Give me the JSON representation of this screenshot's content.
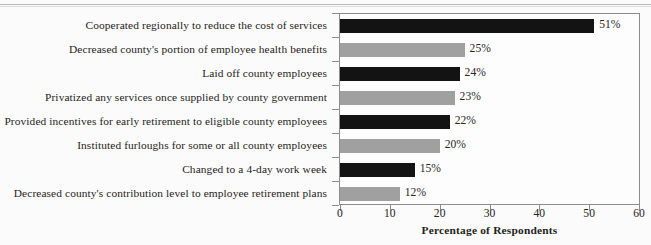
{
  "chart_data": {
    "type": "bar",
    "orientation": "horizontal",
    "title": "",
    "xlabel": "Percentage of Respondents",
    "ylabel": "",
    "xlim": [
      0,
      60
    ],
    "xticks": [
      0,
      10,
      20,
      30,
      40,
      50,
      60
    ],
    "xtick_labels": [
      "0",
      "10",
      "20",
      "30",
      "40",
      "50",
      "60"
    ],
    "grid": false,
    "legend": "none",
    "value_suffix": "%",
    "categories": [
      "Cooperated regionally to reduce the cost of services",
      "Decreased county's portion of employee health benefits",
      "Laid off county employees",
      "Privatized any services once supplied by county government",
      "Provided incentives for early retirement to eligible county employees",
      "Instituted furloughs for some or all county employees",
      "Changed to a 4-day work week",
      "Decreased county's contribution level to employee retirement plans"
    ],
    "values": [
      51,
      25,
      24,
      23,
      22,
      20,
      15,
      12
    ],
    "value_labels": [
      "51%",
      "25%",
      "24%",
      "23%",
      "22%",
      "20%",
      "15%",
      "12%"
    ],
    "bar_colors": [
      "#131313",
      "#a0a0a0",
      "#131313",
      "#a0a0a0",
      "#131313",
      "#a0a0a0",
      "#131313",
      "#a0a0a0"
    ]
  },
  "colors": {
    "dark_bar": "#131313",
    "light_bar": "#a0a0a0",
    "axis": "#8d8d8d",
    "text": "#231f20",
    "background": "#fbfbfb"
  }
}
